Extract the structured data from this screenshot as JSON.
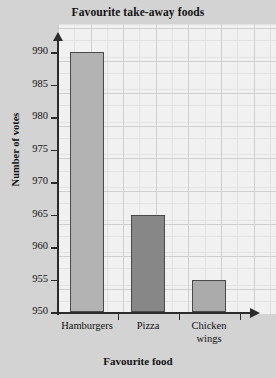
{
  "chart_data": {
    "type": "bar",
    "title": "Favourite take-away foods",
    "xlabel": "Favourite food",
    "ylabel": "Number of votes",
    "categories": [
      "Hamburgers",
      "Pizza",
      "Chicken wings"
    ],
    "category_lines": [
      [
        "Hamburgers"
      ],
      [
        "Pizza"
      ],
      [
        "Chicken",
        "wings"
      ]
    ],
    "values": [
      990,
      965,
      955
    ],
    "ylim": [
      950,
      990
    ],
    "ytick_step": 5,
    "yticks": [
      990,
      985,
      980,
      975,
      970,
      965,
      960,
      955,
      950
    ],
    "ytick_labels": [
      "990",
      "985",
      "980",
      "975",
      "970",
      "965",
      "960",
      "955",
      "950"
    ],
    "grid": true,
    "legend": "none",
    "bar_colors": [
      "#b3b3b3",
      "#878787",
      "#ababab"
    ],
    "bar_edge_color": "#4a4a4a",
    "axis_color": "#2b2b2b",
    "plot_background": "#f1f1f1",
    "figure_background": "#d3d3d3",
    "grid_color_minor": "#e2e2e2",
    "grid_color_major": "#cfcfcf"
  }
}
